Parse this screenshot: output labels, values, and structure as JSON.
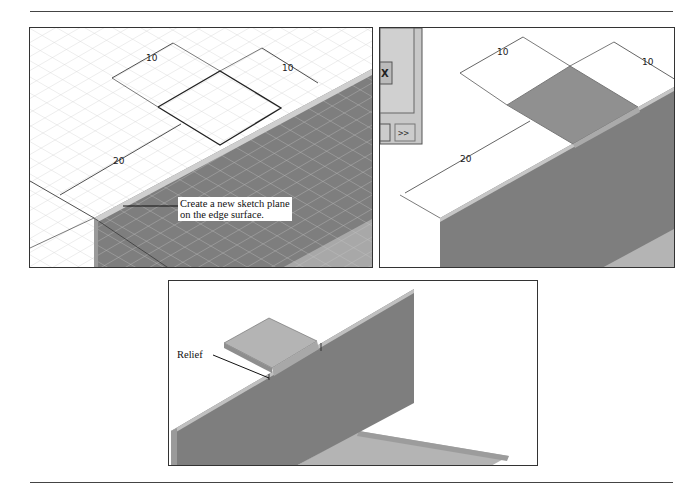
{
  "page": {
    "top_rule": true,
    "bottom_rule": true
  },
  "figure1": {
    "dimensions": {
      "top_left": "10",
      "top_right": "10",
      "side": "20"
    },
    "callout_line1": "Create a new sketch plane",
    "callout_line2": "on the edge surface."
  },
  "figure2": {
    "dimensions": {
      "top_left": "10",
      "top_right": "10",
      "side": "20"
    },
    "dialog_button": ">>"
  },
  "figure3": {
    "callout": "Relief"
  },
  "colors": {
    "face_dark": "#7e7e7e",
    "face_light": "#b4b4b4",
    "grid": "#d8d8d8",
    "line": "#222222"
  }
}
